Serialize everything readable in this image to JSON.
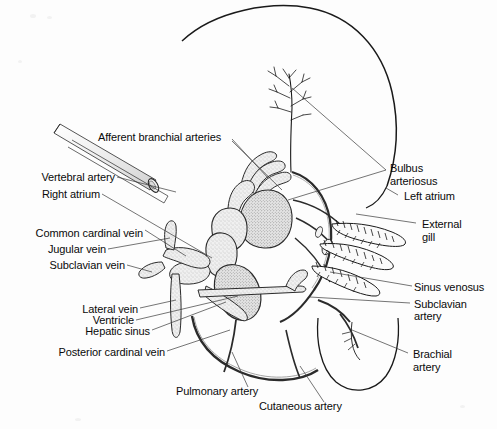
{
  "figure": {
    "background_color": "#fdfdfd",
    "ink_color": "#1a1a1a",
    "leader_color": "#333333",
    "vessel_fill": "#e8e8e8"
  },
  "labels": {
    "afferent_branchial_arteries": "Afferent branchial arteries",
    "vertebral_artery": "Vertebral artery",
    "right_atrium": "Right atrium",
    "common_cardinal_vein": "Common cardinal vein",
    "jugular_vein": "Jugular vein",
    "subclavian_vein": "Subclavian vein",
    "lateral_vein": "Lateral vein",
    "ventricle": "Ventricle",
    "hepatic_sinus": "Hepatic sinus",
    "posterior_cardinal_vein": "Posterior cardinal vein",
    "bulbus_line1": "Bulbus",
    "bulbus_line2": "arteriosus",
    "left_atrium": "Left atrium",
    "external_line1": "External",
    "external_line2": "gill",
    "sinus_venosus": "Sinus venosus",
    "subclavian_artery_line1": "Subclavian",
    "subclavian_artery_line2": "artery",
    "brachial_artery_line1": "Brachial",
    "brachial_artery_line2": "artery",
    "pulmonary_artery": "Pulmonary artery",
    "cutaneous_artery": "Cutaneous artery"
  }
}
